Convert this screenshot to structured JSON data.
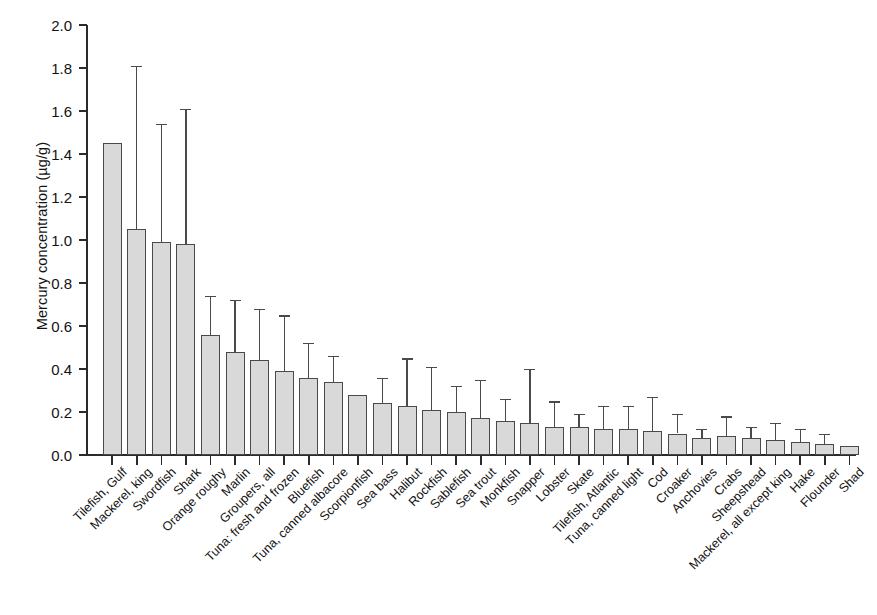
{
  "chart_data": {
    "type": "bar",
    "title": "",
    "xlabel": "",
    "ylabel": "Mercury concentration (µg/g)",
    "ylim": [
      0.0,
      2.0
    ],
    "ytick_labels": [
      "0.0",
      "0.2",
      "0.4",
      "0.6",
      "0.8",
      "1.0",
      "1.2",
      "1.4",
      "1.6",
      "1.8",
      "2.0"
    ],
    "ytick_values": [
      0.0,
      0.2,
      0.4,
      0.6,
      0.8,
      1.0,
      1.2,
      1.4,
      1.6,
      1.8,
      2.0
    ],
    "grid": false,
    "legend": "none",
    "error_bars": "upper only (max / upper range)",
    "categories": [
      "Tilefish, Gulf",
      "Mackerel, king",
      "Swordfish",
      "Shark",
      "Orange roughy",
      "Marlin",
      "Groupers, all",
      "Tuna: fresh and frozen",
      "Bluefish",
      "Tuna, canned albacore",
      "Scorpionfish",
      "Sea bass",
      "Halibut",
      "Rockfish",
      "Sablefish",
      "Sea trout",
      "Monkfish",
      "Snapper",
      "Lobster",
      "Skate",
      "Tilefish, Atlantic",
      "Tuna, canned light",
      "Cod",
      "Croaker",
      "Anchovies",
      "Crabs",
      "Sheepshead",
      "Mackerel, all except king",
      "Hake",
      "Flounder",
      "Shad"
    ],
    "values": [
      1.45,
      1.05,
      0.99,
      0.98,
      0.56,
      0.48,
      0.44,
      0.39,
      0.36,
      0.34,
      0.28,
      0.24,
      0.23,
      0.21,
      0.2,
      0.17,
      0.16,
      0.15,
      0.13,
      0.13,
      0.12,
      0.12,
      0.11,
      0.1,
      0.08,
      0.09,
      0.08,
      0.07,
      0.06,
      0.05,
      0.04
    ],
    "error_upper": [
      null,
      1.81,
      1.54,
      1.61,
      0.74,
      0.72,
      0.68,
      0.65,
      0.52,
      0.46,
      null,
      0.36,
      0.45,
      0.41,
      0.32,
      0.35,
      0.26,
      0.4,
      0.25,
      0.19,
      0.23,
      0.23,
      0.27,
      0.19,
      0.12,
      0.18,
      0.13,
      0.15,
      0.12,
      0.1,
      null
    ],
    "series": [
      {
        "name": "Mean mercury concentration",
        "values": [
          1.45,
          1.05,
          0.99,
          0.98,
          0.56,
          0.48,
          0.44,
          0.39,
          0.36,
          0.34,
          0.28,
          0.24,
          0.23,
          0.21,
          0.2,
          0.17,
          0.16,
          0.15,
          0.13,
          0.13,
          0.12,
          0.12,
          0.11,
          0.1,
          0.08,
          0.09,
          0.08,
          0.07,
          0.06,
          0.05,
          0.04
        ]
      }
    ],
    "colors": {
      "bar_fill": "#d9d9d9",
      "bar_edge": "#4a4a4a",
      "axis": "#2b2b2b",
      "text": "#131313",
      "background": "#ffffff"
    }
  }
}
